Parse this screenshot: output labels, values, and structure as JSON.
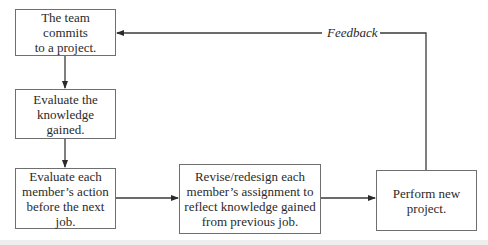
{
  "diagram": {
    "type": "flowchart",
    "nodes": [
      {
        "id": "commit",
        "label": "The team commits\nto a project."
      },
      {
        "id": "evaluate_knowledge",
        "label": "Evaluate the\nknowledge gained."
      },
      {
        "id": "evaluate_members",
        "label": "Evaluate each\nmember’s action\nbefore the next job."
      },
      {
        "id": "revise",
        "label": "Revise/redesign each\nmember’s assignment to\nreflect knowledge gained\nfrom previous job."
      },
      {
        "id": "perform",
        "label": "Perform new\nproject."
      }
    ],
    "edges": [
      {
        "from": "commit",
        "to": "evaluate_knowledge",
        "label": ""
      },
      {
        "from": "evaluate_knowledge",
        "to": "evaluate_members",
        "label": ""
      },
      {
        "from": "evaluate_members",
        "to": "revise",
        "label": ""
      },
      {
        "from": "revise",
        "to": "perform",
        "label": ""
      },
      {
        "from": "perform",
        "to": "commit",
        "label": "Feedback"
      }
    ],
    "feedback_label": "Feedback",
    "colors": {
      "line": "#3a3a3a",
      "box_border": "#6f6f6f",
      "text": "#2a2a2a"
    }
  }
}
